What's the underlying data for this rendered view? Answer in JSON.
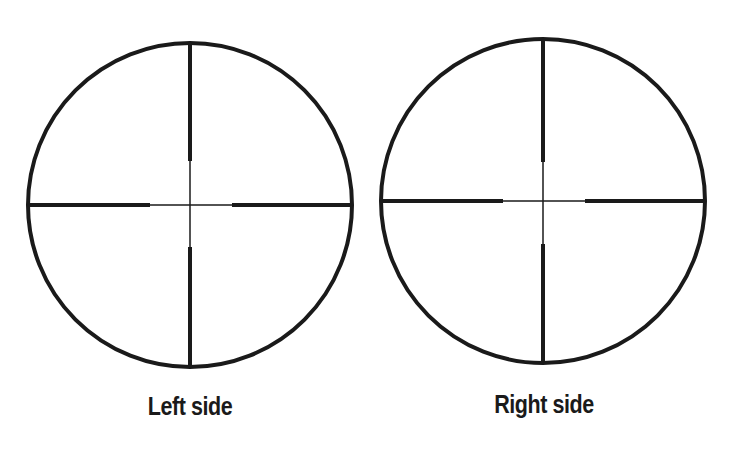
{
  "figure": {
    "background": "#ffffff",
    "ink_color": "#1a1a1a",
    "reticles": [
      {
        "id": "left",
        "caption": "Left side",
        "cx": 190,
        "cy": 205,
        "r": 162,
        "ring_stroke": 4,
        "post_stroke": 4,
        "fine_stroke": 1.5,
        "post_gap": {
          "top": 44,
          "bottom": 42,
          "left": 40,
          "right": 42
        }
      },
      {
        "id": "right",
        "caption": "Right side",
        "cx": 543,
        "cy": 201,
        "r": 162,
        "ring_stroke": 4,
        "post_stroke": 4,
        "fine_stroke": 1.5,
        "post_gap": {
          "top": 39,
          "bottom": 43,
          "left": 40,
          "right": 42
        }
      }
    ]
  }
}
